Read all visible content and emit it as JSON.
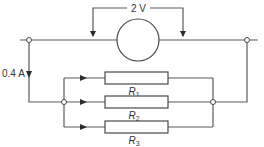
{
  "diagram": {
    "type": "circuit",
    "voltmeter": {
      "label": "2 V"
    },
    "current": {
      "label": "0.4 A"
    },
    "resistors": [
      {
        "name": "R",
        "sub": "1"
      },
      {
        "name": "R",
        "sub": "2"
      },
      {
        "name": "R",
        "sub": "3"
      }
    ],
    "colors": {
      "wire": "#5a5a5a",
      "text": "#333333",
      "background": "#ffffff"
    }
  }
}
